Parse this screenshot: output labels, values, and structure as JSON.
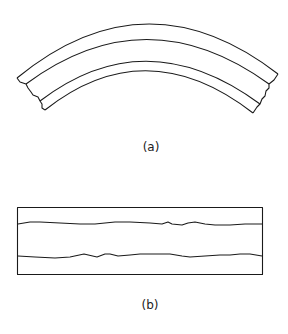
{
  "figure": {
    "panels": [
      {
        "id": "a",
        "label": "(a)",
        "description": "Curved layered strip (arc) with three bands and broken ends"
      },
      {
        "id": "b",
        "label": "(b)",
        "description": "Straight layered strip (rectangle) with two wavy interior boundaries"
      }
    ],
    "colors": {
      "line": "#1a1a1a",
      "background": "#ffffff"
    }
  }
}
